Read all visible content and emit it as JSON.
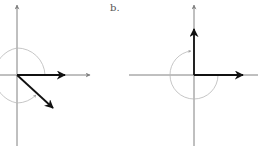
{
  "panels": [
    {
      "label": "",
      "origin": [
        17,
        75
      ],
      "description": "Rotation of vector by angle exceeding 270 degrees (clockwise appearance)"
    },
    {
      "label": "b.",
      "origin": [
        194,
        75
      ],
      "description": "Rotation of horizontal vector by 270 degrees ending at vertical"
    }
  ],
  "colors": {
    "axis": "#808080",
    "vector": "#111111",
    "arc": "#b0b0b0"
  }
}
